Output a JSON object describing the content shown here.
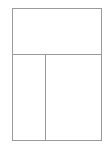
{
  "diagram": {
    "type": "layout-wireframe",
    "line_color": "#9a9a9a",
    "background_color": "#ffffff",
    "panels": [
      {
        "id": "top",
        "label": ""
      },
      {
        "id": "bottom-left",
        "label": ""
      },
      {
        "id": "bottom-right",
        "label": ""
      }
    ]
  }
}
